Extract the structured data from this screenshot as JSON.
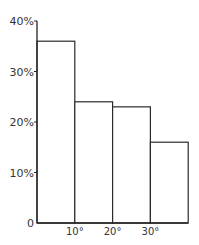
{
  "chart_data": {
    "type": "bar",
    "title": "",
    "xlabel": "",
    "ylabel": "",
    "bin_edges": [
      0,
      10,
      20,
      30,
      40
    ],
    "values": [
      36,
      24,
      23,
      16
    ],
    "ylim": [
      0,
      40
    ],
    "yticks": [
      0,
      10,
      20,
      30,
      40
    ],
    "ytick_labels": [
      "0",
      "10%",
      "20%",
      "30%",
      "40%"
    ],
    "xticks": [
      10,
      20,
      30
    ],
    "xtick_labels": [
      "10°",
      "20°",
      "30°"
    ],
    "grid": false,
    "legend": null
  }
}
